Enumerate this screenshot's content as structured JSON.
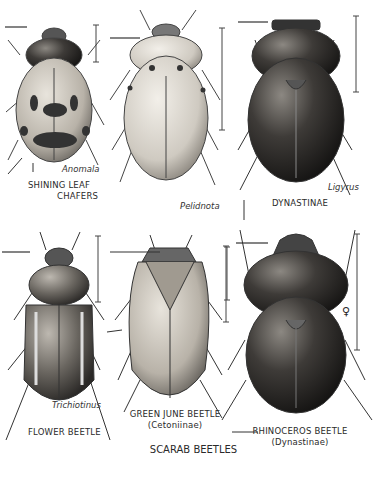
{
  "title": "SCARAB BEETLES",
  "figures": [
    {
      "genus": "Anomala",
      "group_label_line1": "SHINING LEAF",
      "group_label_line2": "CHAFERS"
    },
    {
      "genus": "Pelidnota"
    },
    {
      "genus": "Ligyrus",
      "group_label": "DYNASTINAE"
    },
    {
      "genus": "Trichiotinus",
      "common_name": "FLOWER BEETLE"
    },
    {
      "common_name": "GREEN JUNE BEETLE",
      "subfamily": "(Cetoniinae)"
    },
    {
      "common_name": "RHINOCEROS BEETLE",
      "subfamily": "(Dynastinae)",
      "sex_symbol": "♀"
    }
  ]
}
